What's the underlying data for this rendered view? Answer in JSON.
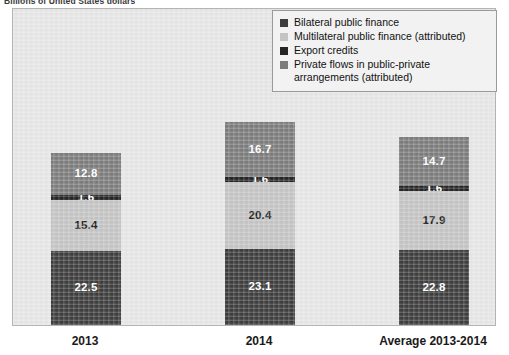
{
  "axis_title": "Billions of United States dollars",
  "legend": {
    "items": [
      {
        "label": "Bilateral public finance",
        "color": "#3d3d3d"
      },
      {
        "label": "Multilateral public finance (attributed)",
        "color": "#c4c4c4"
      },
      {
        "label": "Export credits",
        "color": "#242424"
      },
      {
        "label": "Private flows in public-private arrangements (attributed)",
        "color": "#7c7c7c"
      }
    ]
  },
  "categories": [
    "2013",
    "2014",
    "Average 2013-2014"
  ],
  "chart_data": {
    "type": "bar",
    "subtype": "stacked-bar",
    "title": "Billions of United States dollars",
    "xlabel": "",
    "ylabel": "Billions of United States dollars",
    "grid": false,
    "legend_position": "top-right",
    "categories": [
      "2013",
      "2014",
      "Average 2013-2014"
    ],
    "series": [
      {
        "name": "Bilateral public finance",
        "color": "#3d3d3d",
        "values": [
          22.5,
          23.1,
          22.8
        ],
        "labels": [
          "22.5",
          "23.1",
          "22.8"
        ]
      },
      {
        "name": "Multilateral public finance (attributed)",
        "color": "#c4c4c4",
        "values": [
          15.4,
          20.4,
          17.9
        ],
        "labels": [
          "15.4",
          "20.4",
          "17.9"
        ]
      },
      {
        "name": "Export credits",
        "color": "#242424",
        "values": [
          1.6,
          1.6,
          1.6
        ],
        "labels": [
          "1.6",
          "1.6",
          "1.6"
        ]
      },
      {
        "name": "Private flows in public-private arrangements (attributed)",
        "color": "#7c7c7c",
        "values": [
          12.8,
          16.7,
          14.7
        ],
        "labels": [
          "12.8",
          "16.7",
          "14.7"
        ]
      }
    ],
    "totals": [
      52.3,
      61.8,
      57.0
    ],
    "ylim": [
      0,
      62
    ]
  },
  "style": {
    "plot_background": "#e6e6e6",
    "plot_border": "#b4b4b4",
    "legend_background": "#f2f2f2",
    "legend_border": "#9a9a9a",
    "label_light": "#ffffff",
    "label_dark": "#1c1c1c"
  }
}
